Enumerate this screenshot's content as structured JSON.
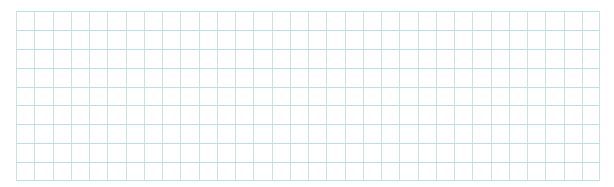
{
  "grid": {
    "columns": 32,
    "rows": 9,
    "x": 16,
    "y": 11,
    "width": 584,
    "height": 170,
    "colors": {
      "background": "#ffffff",
      "horizontal_line": "#b8dfe3",
      "vertical_line": "#cfdfe2"
    }
  }
}
